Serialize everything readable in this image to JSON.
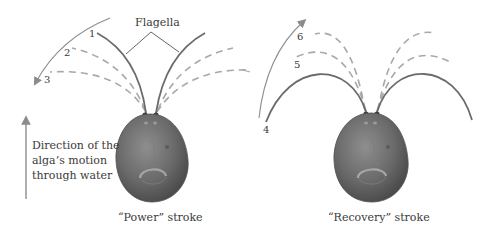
{
  "labels": {
    "flagella": "Flagella",
    "direction_line1": "Direction of the",
    "direction_line2": "alga’s motion",
    "direction_line3": "through water",
    "power_caption": "“Power” stroke",
    "recovery_caption": "“Recovery” stroke"
  },
  "positions": {
    "n1": "1",
    "n2": "2",
    "n3": "3",
    "n4": "4",
    "n5": "5",
    "n6": "6"
  },
  "colors": {
    "solid_flagellum": "#6b6b6b",
    "dashed_flagellum": "#a8a8a8",
    "arrow": "#8c8c8c",
    "body_dark": "#4f4f4f",
    "body_light": "#8a8a8a",
    "text": "#3a3a3a"
  }
}
